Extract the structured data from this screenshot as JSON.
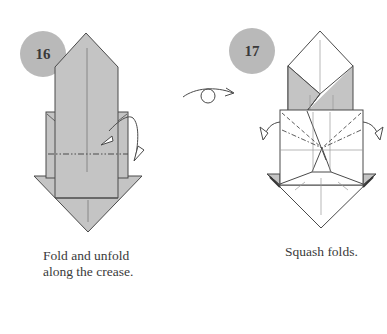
{
  "diagram": {
    "colors": {
      "paper_gray": "#c4c4c4",
      "paper_white": "#ffffff",
      "line": "#4a4a4a",
      "crease": "#9a9a9a",
      "step_circle": "#b9b9b9",
      "text": "#3a3a3a"
    },
    "steps": [
      {
        "number": "16",
        "caption_line1": "Fold and unfold",
        "caption_line2": "along the crease.",
        "arrow": "fold-and-unfold-arrow",
        "fold_line": "mountain-fold-dash-dot"
      },
      {
        "number": "17",
        "caption_line1": "Squash folds.",
        "arrows": [
          "squash-arrow-left",
          "squash-arrow-right"
        ]
      }
    ],
    "transition_symbol": "turn-over-arrow"
  }
}
